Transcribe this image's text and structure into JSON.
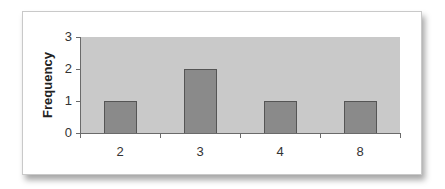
{
  "chart_data": {
    "type": "bar",
    "title": "",
    "categories": [
      "2",
      "3",
      "4",
      "8"
    ],
    "values": [
      1,
      2,
      1,
      1
    ],
    "xlabel": "",
    "ylabel": "Frequency",
    "ylim": [
      0,
      3
    ],
    "yticks": [
      "0",
      "1",
      "2",
      "3"
    ],
    "grid": false,
    "legend": null
  },
  "colors": {
    "plot_background": "#c9c9c9",
    "bar_fill": "#8a8a8a",
    "bar_border": "#555555",
    "axis": "#6a6a6a"
  }
}
